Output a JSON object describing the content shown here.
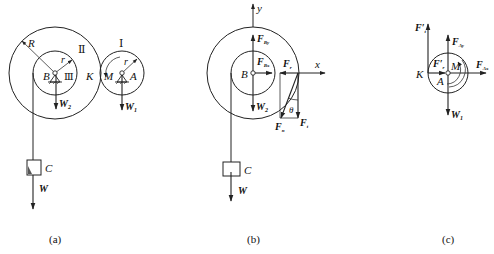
{
  "figure": {
    "panels": [
      {
        "caption": "(a)",
        "labels": {
          "outer_radius": "R",
          "inner_radius": "r",
          "wheel_II": "Ⅱ",
          "wheel_III": "Ⅲ",
          "wheel_I": "Ⅰ",
          "center_B": "B",
          "center_A": "A",
          "contact_K": "K",
          "moment_M": "M",
          "radius_I": "r",
          "weight_2": "W",
          "weight_2_sub": "2",
          "weight_1": "W",
          "weight_1_sub": "1",
          "block_C": "C",
          "weight_C": "W"
        }
      },
      {
        "caption": "(b)",
        "labels": {
          "axis_y": "y",
          "axis_x": "x",
          "center_B": "B",
          "force_By": "F",
          "force_By_sub": "By",
          "force_Bx": "F",
          "force_Bx_sub": "Bx",
          "force_r": "F",
          "force_r_sub": "r",
          "force_t": "F",
          "force_t_sub": "t",
          "force_n": "F",
          "force_n_sub": "n",
          "angle": "θ",
          "weight_2": "W",
          "weight_2_sub": "2",
          "block_C": "C",
          "weight_C": "W"
        }
      },
      {
        "caption": "(c)",
        "labels": {
          "force_t_prime": "F′",
          "force_t_prime_sub": "t",
          "force_r_prime": "F′",
          "force_r_prime_sub": "r",
          "force_Ay": "F",
          "force_Ay_sub": "Ay",
          "force_Ax": "F",
          "force_Ax_sub": "Ax",
          "contact_K": "K",
          "center_A": "A",
          "moment_M": "M",
          "weight_1": "W",
          "weight_1_sub": "1"
        }
      }
    ]
  }
}
